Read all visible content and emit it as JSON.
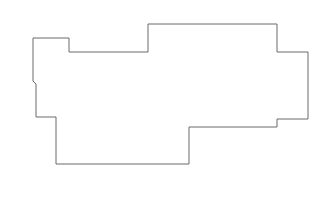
{
  "canvas": {
    "width": 330,
    "height": 218,
    "background_color": "#ffffff",
    "title": "Building Footprint Outline"
  },
  "shape": {
    "name": "building-footprint-polygon",
    "type": "closed-polygon",
    "stroke_color": "#6a6a6a",
    "fill_color": "#ffffff",
    "stroke_width": 1,
    "vertex_count": 18,
    "points": [
      [
        33,
        38
      ],
      [
        69,
        38
      ],
      [
        69,
        52
      ],
      [
        148,
        52
      ],
      [
        148,
        24
      ],
      [
        277,
        24
      ],
      [
        277,
        52
      ],
      [
        308,
        52
      ],
      [
        308,
        119
      ],
      [
        277,
        119
      ],
      [
        277,
        127
      ],
      [
        189,
        127
      ],
      [
        189,
        164
      ],
      [
        56,
        164
      ],
      [
        56,
        117
      ],
      [
        36,
        117
      ],
      [
        36,
        84
      ],
      [
        33,
        81
      ]
    ],
    "points_string": "33,38 69,38 69,52 148,52 148,24 277,24 277,52 308,52 308,119 277,119 277,127 189,127 189,164 56,164 56,117 36,117 36,84 33,81",
    "bounding_box": {
      "left": 33,
      "top": 24,
      "right": 308,
      "bottom": 164,
      "width": 275,
      "height": 140
    }
  }
}
